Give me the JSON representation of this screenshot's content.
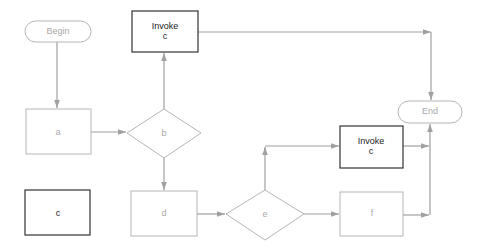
{
  "diagram": {
    "type": "flowchart",
    "colors": {
      "faint_stroke": "#b5b5b5",
      "dark_stroke": "#333333",
      "edge": "#a0a0a0",
      "faint_text": "#a8a8a8",
      "dark_text": "#222222"
    },
    "nodes": {
      "begin": {
        "label": "Begin",
        "shape": "terminal"
      },
      "a": {
        "label": "a",
        "shape": "process"
      },
      "b": {
        "label": "b",
        "shape": "decision"
      },
      "invoke_top": {
        "line1": "Invoke",
        "line2": "c",
        "shape": "process"
      },
      "c": {
        "label": "c",
        "shape": "process"
      },
      "d": {
        "label": "d",
        "shape": "process"
      },
      "e": {
        "label": "e",
        "shape": "decision"
      },
      "invoke_right": {
        "line1": "Invoke",
        "line2": "c",
        "shape": "process"
      },
      "f": {
        "label": "f",
        "shape": "process"
      },
      "end": {
        "label": "End",
        "shape": "terminal"
      }
    },
    "edges": [
      {
        "from": "begin",
        "to": "a"
      },
      {
        "from": "a",
        "to": "b"
      },
      {
        "from": "b",
        "to": "invoke_top"
      },
      {
        "from": "b",
        "to": "d"
      },
      {
        "from": "invoke_top",
        "to": "end"
      },
      {
        "from": "d",
        "to": "e"
      },
      {
        "from": "e",
        "to": "invoke_right"
      },
      {
        "from": "e",
        "to": "f"
      },
      {
        "from": "invoke_right",
        "to": "end"
      },
      {
        "from": "f",
        "to": "end"
      }
    ]
  }
}
